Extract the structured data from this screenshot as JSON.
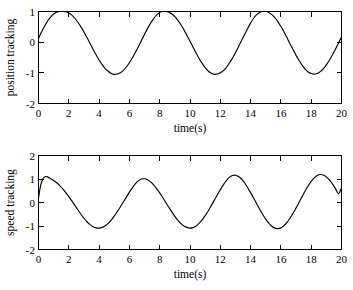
{
  "chart_data": [
    {
      "type": "line",
      "panel_id": "position",
      "title": "",
      "xlabel": "time(s)",
      "ylabel": "position tracking",
      "xlim": [
        0,
        20
      ],
      "ylim": [
        -2,
        1
      ],
      "xticks": [
        0,
        2,
        4,
        6,
        8,
        10,
        12,
        14,
        16,
        18,
        20
      ],
      "xticklabels": [
        "0",
        "2",
        "4",
        "6",
        "8",
        "10",
        "12",
        "14",
        "16",
        "18",
        "20"
      ],
      "yticks": [
        1,
        0,
        -1,
        -2
      ],
      "yticklabels": [
        "1",
        "0",
        "-1",
        "-2"
      ],
      "grid": false,
      "legend": null,
      "line_color": "#000000",
      "series": [
        {
          "name": "position tracking",
          "x": [
            0.0,
            0.2,
            0.4,
            0.6,
            0.8,
            1.0,
            1.2,
            1.4,
            1.6,
            1.8,
            2.0,
            2.2,
            2.4,
            2.6,
            2.8,
            3.0,
            3.2,
            3.4,
            3.6,
            3.8,
            4.0,
            4.2,
            4.4,
            4.6,
            4.8,
            5.0,
            5.2,
            5.4,
            5.6,
            5.8,
            6.0,
            6.2,
            6.4,
            6.6,
            6.8,
            7.0,
            7.2,
            7.4,
            7.6,
            7.8,
            8.0,
            8.2,
            8.4,
            8.6,
            8.8,
            9.0,
            9.2,
            9.4,
            9.6,
            9.8,
            10.0,
            10.2,
            10.4,
            10.6,
            10.8,
            11.0,
            11.2,
            11.4,
            11.6,
            11.8,
            12.0,
            12.2,
            12.4,
            12.6,
            12.8,
            13.0,
            13.2,
            13.4,
            13.6,
            13.8,
            14.0,
            14.2,
            14.4,
            14.6,
            14.8,
            15.0,
            15.2,
            15.4,
            15.6,
            15.8,
            16.0,
            16.2,
            16.4,
            16.6,
            16.8,
            17.0,
            17.2,
            17.4,
            17.6,
            17.8,
            18.0,
            18.2,
            18.4,
            18.6,
            18.8,
            19.0,
            19.2,
            19.4,
            19.6,
            19.8,
            20.0
          ],
          "y": [
            0.12,
            0.33,
            0.52,
            0.69,
            0.82,
            0.92,
            0.98,
            1.0,
            1.0,
            0.99,
            0.95,
            0.88,
            0.78,
            0.65,
            0.5,
            0.33,
            0.15,
            -0.04,
            -0.23,
            -0.41,
            -0.58,
            -0.73,
            -0.86,
            -0.95,
            -1.02,
            -1.05,
            -1.04,
            -1.0,
            -0.92,
            -0.81,
            -0.67,
            -0.51,
            -0.33,
            -0.14,
            0.06,
            0.26,
            0.45,
            0.62,
            0.77,
            0.89,
            0.97,
            1.0,
            1.0,
            0.98,
            0.92,
            0.83,
            0.71,
            0.57,
            0.4,
            0.22,
            0.03,
            -0.16,
            -0.35,
            -0.53,
            -0.69,
            -0.83,
            -0.94,
            -1.01,
            -1.05,
            -1.04,
            -1.0,
            -0.93,
            -0.82,
            -0.68,
            -0.52,
            -0.34,
            -0.15,
            0.05,
            0.25,
            0.44,
            0.62,
            0.78,
            0.9,
            0.97,
            1.0,
            1.0,
            0.97,
            0.9,
            0.8,
            0.67,
            0.51,
            0.34,
            0.15,
            -0.05,
            -0.24,
            -0.43,
            -0.6,
            -0.75,
            -0.88,
            -0.97,
            -1.02,
            -1.04,
            -1.02,
            -0.96,
            -0.87,
            -0.74,
            -0.59,
            -0.42,
            -0.23,
            -0.03,
            0.17
          ]
        }
      ]
    },
    {
      "type": "line",
      "panel_id": "speed",
      "title": "",
      "xlabel": "time(s)",
      "ylabel": "speed tracking",
      "xlim": [
        0,
        20
      ],
      "ylim": [
        -2,
        2
      ],
      "xticks": [
        0,
        2,
        4,
        6,
        8,
        10,
        12,
        14,
        16,
        18,
        20
      ],
      "xticklabels": [
        "0",
        "2",
        "4",
        "6",
        "8",
        "10",
        "12",
        "14",
        "16",
        "18",
        "20"
      ],
      "yticks": [
        2,
        1,
        0,
        -1,
        -2
      ],
      "yticklabels": [
        "2",
        "1",
        "0",
        "-1",
        "-2"
      ],
      "grid": false,
      "legend": null,
      "line_color": "#000000",
      "series": [
        {
          "name": "speed tracking",
          "x": [
            0.0,
            0.15,
            0.3,
            0.45,
            0.6,
            0.8,
            1.0,
            1.2,
            1.4,
            1.6,
            1.8,
            2.0,
            2.2,
            2.4,
            2.6,
            2.8,
            3.0,
            3.2,
            3.4,
            3.6,
            3.8,
            4.0,
            4.2,
            4.4,
            4.6,
            4.8,
            5.0,
            5.2,
            5.4,
            5.6,
            5.8,
            6.0,
            6.2,
            6.4,
            6.6,
            6.8,
            7.0,
            7.2,
            7.4,
            7.6,
            7.8,
            8.0,
            8.2,
            8.4,
            8.6,
            8.8,
            9.0,
            9.2,
            9.4,
            9.6,
            9.8,
            10.0,
            10.2,
            10.4,
            10.6,
            10.8,
            11.0,
            11.2,
            11.4,
            11.6,
            11.8,
            12.0,
            12.2,
            12.4,
            12.6,
            12.8,
            13.0,
            13.2,
            13.4,
            13.6,
            13.8,
            14.0,
            14.2,
            14.4,
            14.6,
            14.8,
            15.0,
            15.2,
            15.4,
            15.6,
            15.8,
            16.0,
            16.2,
            16.4,
            16.6,
            16.8,
            17.0,
            17.2,
            17.4,
            17.6,
            17.8,
            18.0,
            18.2,
            18.4,
            18.6,
            18.8,
            19.0,
            19.2,
            19.4,
            19.6,
            19.8,
            20.0
          ],
          "y": [
            0.2,
            0.75,
            1.02,
            1.1,
            1.09,
            1.02,
            0.94,
            0.84,
            0.72,
            0.58,
            0.42,
            0.25,
            0.07,
            -0.12,
            -0.31,
            -0.5,
            -0.67,
            -0.82,
            -0.94,
            -1.03,
            -1.08,
            -1.09,
            -1.06,
            -0.99,
            -0.89,
            -0.75,
            -0.58,
            -0.39,
            -0.19,
            0.02,
            0.23,
            0.44,
            0.63,
            0.8,
            0.93,
            1.0,
            1.01,
            0.97,
            0.88,
            0.75,
            0.59,
            0.41,
            0.21,
            0.0,
            -0.2,
            -0.4,
            -0.59,
            -0.76,
            -0.9,
            -1.0,
            -1.06,
            -1.09,
            -1.07,
            -1.0,
            -0.89,
            -0.74,
            -0.56,
            -0.36,
            -0.14,
            0.09,
            0.32,
            0.54,
            0.75,
            0.93,
            1.07,
            1.15,
            1.16,
            1.11,
            1.0,
            0.84,
            0.64,
            0.42,
            0.19,
            -0.05,
            -0.29,
            -0.51,
            -0.71,
            -0.88,
            -1.01,
            -1.09,
            -1.11,
            -1.08,
            -0.99,
            -0.85,
            -0.67,
            -0.46,
            -0.23,
            0.01,
            0.25,
            0.49,
            0.71,
            0.9,
            1.05,
            1.15,
            1.19,
            1.17,
            1.09,
            0.96,
            0.79,
            0.59,
            0.37,
            0.62
          ]
        }
      ]
    }
  ],
  "panels": {
    "position": {
      "ylabel": "position tracking",
      "xlabel": "time(s)",
      "yticklabels": [
        "1",
        "0",
        "-1",
        "-2"
      ],
      "xticklabels": [
        "0",
        "2",
        "4",
        "6",
        "8",
        "10",
        "12",
        "14",
        "16",
        "18",
        "20"
      ]
    },
    "speed": {
      "ylabel": "speed tracking",
      "xlabel": "time(s)",
      "yticklabels": [
        "2",
        "1",
        "0",
        "-1",
        "-2"
      ],
      "xticklabels": [
        "0",
        "2",
        "4",
        "6",
        "8",
        "10",
        "12",
        "14",
        "16",
        "18",
        "20"
      ]
    }
  }
}
